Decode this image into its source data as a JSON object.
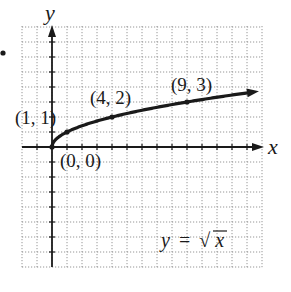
{
  "chart_data": {
    "type": "line",
    "title": "",
    "function": "y = sqrt(x)",
    "equation_label": {
      "lhs": "y",
      "eq": "=",
      "radical": "√",
      "arg": "x"
    },
    "xlabel": "x",
    "ylabel": "y",
    "xlim": [
      -2,
      14
    ],
    "ylim": [
      -8,
      8
    ],
    "grid": true,
    "grid_style": "dotted",
    "legend": "none",
    "series": [
      {
        "name": "y = √x",
        "x": [
          0,
          0.25,
          1,
          2,
          4,
          6,
          9,
          12,
          14
        ],
        "y": [
          0,
          0.5,
          1,
          1.414,
          2,
          2.449,
          3,
          3.464,
          3.742
        ]
      }
    ],
    "points": [
      {
        "x": 0,
        "y": 0,
        "label": "(0, 0)"
      },
      {
        "x": 1,
        "y": 1,
        "label": "(1, 1)"
      },
      {
        "x": 4,
        "y": 2,
        "label": "(4, 2)"
      },
      {
        "x": 9,
        "y": 3,
        "label": "(9, 3)"
      }
    ]
  },
  "colors": {
    "ink": "#1a1a1a",
    "grid": "#8a8a8a",
    "background": "#ffffff"
  }
}
